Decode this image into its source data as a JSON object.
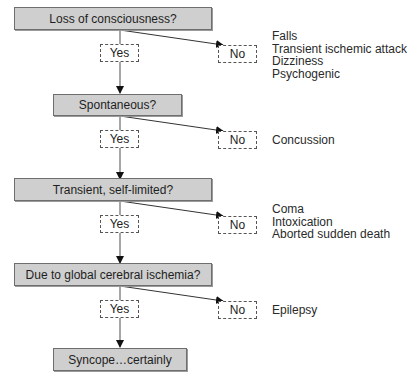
{
  "flowchart": {
    "questions": [
      {
        "label": "Loss of consciousness?"
      },
      {
        "label": "Spontaneous?"
      },
      {
        "label": "Transient, self-limited?"
      },
      {
        "label": "Due to global cerebral ischemia?"
      }
    ],
    "yes_label": "Yes",
    "no_label": "No",
    "outcomes": [
      {
        "items": [
          "Falls",
          "Transient ischemic attack",
          "Dizziness",
          "Psychogenic"
        ]
      },
      {
        "items": [
          "Concussion"
        ]
      },
      {
        "items": [
          "Coma",
          "Intoxication",
          "Aborted sudden death"
        ]
      },
      {
        "items": [
          "Epilepsy"
        ]
      }
    ],
    "final": {
      "label": "Syncope…certainly"
    }
  }
}
